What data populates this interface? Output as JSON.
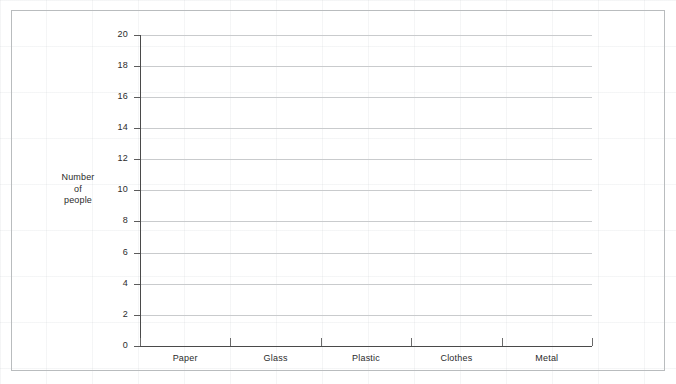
{
  "frame": {
    "border_color": "#b9bcbe",
    "background_color": "#ffffff"
  },
  "chart_data": {
    "type": "bar",
    "title": "",
    "subtitle": "",
    "xlabel": "",
    "ylabel": "Number of people",
    "ylabel_lines": [
      "Number",
      "of",
      "people"
    ],
    "categories": [
      "Paper",
      "Glass",
      "Plastic",
      "Clothes",
      "Metal"
    ],
    "values": [
      0,
      0,
      0,
      0,
      0
    ],
    "series": [
      {
        "name": "Number of people",
        "values": [
          0,
          0,
          0,
          0,
          0
        ]
      }
    ],
    "ylim": [
      0,
      20
    ],
    "ytick_step": 2,
    "ytick_labels": [
      "20",
      "18",
      "16",
      "14",
      "12",
      "10",
      "8",
      "6",
      "4",
      "2",
      "0"
    ],
    "ytick_values": [
      20,
      18,
      16,
      14,
      12,
      10,
      8,
      6,
      4,
      2,
      0
    ],
    "grid": true,
    "grid_axis": "y",
    "grid_color": "#c9cbcd",
    "axis_color": "#4a4a4a",
    "legend": false,
    "legend_position": "none",
    "annotations": []
  }
}
